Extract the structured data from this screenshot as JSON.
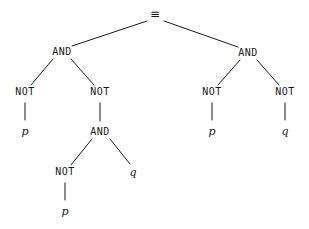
{
  "diagram": {
    "background_color": "#ffffff",
    "line_color": "#1a1a1a",
    "text_color": "#1a1a1a",
    "width": 309,
    "height": 229
  },
  "nodes": [
    {
      "id": "root",
      "label": "≡",
      "kind": "root",
      "x": 155,
      "y": 14
    },
    {
      "id": "and-l",
      "label": "AND",
      "kind": "op",
      "x": 62,
      "y": 52
    },
    {
      "id": "and-r",
      "label": "AND",
      "kind": "op",
      "x": 248,
      "y": 53
    },
    {
      "id": "not-l1",
      "label": "NOT",
      "kind": "op",
      "x": 25,
      "y": 92
    },
    {
      "id": "not-l2",
      "label": "NOT",
      "kind": "op",
      "x": 100,
      "y": 92
    },
    {
      "id": "not-r1",
      "label": "NOT",
      "kind": "op",
      "x": 212,
      "y": 92
    },
    {
      "id": "not-r2",
      "label": "NOT",
      "kind": "op",
      "x": 285,
      "y": 92
    },
    {
      "id": "p-l1",
      "label": "p",
      "kind": "var",
      "x": 25,
      "y": 131
    },
    {
      "id": "and-mid",
      "label": "AND",
      "kind": "op",
      "x": 100,
      "y": 132
    },
    {
      "id": "p-r1",
      "label": "p",
      "kind": "var",
      "x": 212,
      "y": 131
    },
    {
      "id": "q-r2",
      "label": "q",
      "kind": "var",
      "x": 285,
      "y": 131
    },
    {
      "id": "not-deep",
      "label": "NOT",
      "kind": "op",
      "x": 65,
      "y": 172
    },
    {
      "id": "q-mid",
      "label": "q",
      "kind": "var",
      "x": 133,
      "y": 172
    },
    {
      "id": "p-deep",
      "label": "p",
      "kind": "var",
      "x": 65,
      "y": 211
    }
  ],
  "edges": [
    {
      "id": "e-root-andl",
      "from": "root",
      "to": "and-l",
      "x1": 147,
      "y1": 21,
      "x2": 72,
      "y2": 46
    },
    {
      "id": "e-root-andr",
      "from": "root",
      "to": "and-r",
      "x1": 164,
      "y1": 21,
      "x2": 238,
      "y2": 47
    },
    {
      "id": "e-andl-notl1",
      "from": "and-l",
      "to": "not-l1",
      "x1": 53,
      "y1": 59,
      "x2": 31,
      "y2": 85
    },
    {
      "id": "e-andl-notl2",
      "from": "and-l",
      "to": "not-l2",
      "x1": 71,
      "y1": 59,
      "x2": 94,
      "y2": 85
    },
    {
      "id": "e-andr-notr1",
      "from": "and-r",
      "to": "not-r1",
      "x1": 240,
      "y1": 60,
      "x2": 218,
      "y2": 85
    },
    {
      "id": "e-andr-notr2",
      "from": "and-r",
      "to": "not-r2",
      "x1": 257,
      "y1": 60,
      "x2": 279,
      "y2": 85
    },
    {
      "id": "e-notl1-pl1",
      "from": "not-l1",
      "to": "p-l1",
      "x1": 25,
      "y1": 103,
      "x2": 25,
      "y2": 120
    },
    {
      "id": "e-notl2-andm",
      "from": "not-l2",
      "to": "and-mid",
      "x1": 100,
      "y1": 103,
      "x2": 100,
      "y2": 121
    },
    {
      "id": "e-notr1-pr1",
      "from": "not-r1",
      "to": "p-r1",
      "x1": 212,
      "y1": 103,
      "x2": 212,
      "y2": 120
    },
    {
      "id": "e-notr2-qr2",
      "from": "not-r2",
      "to": "q-r2",
      "x1": 285,
      "y1": 103,
      "x2": 285,
      "y2": 120
    },
    {
      "id": "e-andm-notd",
      "from": "and-mid",
      "to": "not-deep",
      "x1": 92,
      "y1": 139,
      "x2": 71,
      "y2": 165
    },
    {
      "id": "e-andm-qmid",
      "from": "and-mid",
      "to": "q-mid",
      "x1": 110,
      "y1": 139,
      "x2": 130,
      "y2": 164
    },
    {
      "id": "e-notd-pdeep",
      "from": "not-deep",
      "to": "p-deep",
      "x1": 65,
      "y1": 183,
      "x2": 65,
      "y2": 200
    }
  ]
}
